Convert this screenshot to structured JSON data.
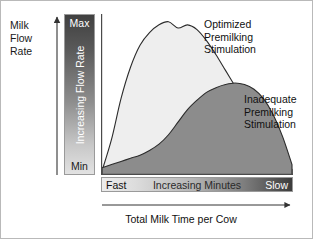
{
  "axes": {
    "y_caption_lines": [
      "Milk",
      "Flow",
      "Rate"
    ],
    "y_ramp": {
      "max_label": "Max",
      "min_label": "Min",
      "rotated_label": "Increasing Flow Rate"
    },
    "x_ramp": {
      "left_label": "Fast",
      "center_label": "Increasing Minutes",
      "right_label": "Slow"
    },
    "bottom_caption": "Total Milk Time per Cow"
  },
  "callouts": {
    "optimized": [
      "Optimized",
      "Premilking",
      "Stimulation"
    ],
    "inadequate": [
      "Inadequate",
      "Premilking",
      "Stimulation"
    ]
  },
  "colors": {
    "optimized_fill": "#eeeeee",
    "inadequate_fill": "#8c8c8c",
    "curve_stroke": "#2b2b2b",
    "plot_border": "#4a4a4a"
  },
  "chart_data": {
    "type": "area",
    "title": "",
    "subtitle": "",
    "xlabel": "Total Milk Time per Cow",
    "ylabel": "Milk Flow Rate",
    "x_axis": {
      "label": "Increasing Minutes",
      "left_tick": "Fast",
      "right_tick": "Slow",
      "range_labels": [
        "Fast",
        "Slow"
      ],
      "gradient": true,
      "ticks": []
    },
    "y_axis": {
      "label": "Increasing Flow Rate",
      "bottom_tick": "Min",
      "top_tick": "Max",
      "range_labels": [
        "Min",
        "Max"
      ],
      "gradient": true,
      "ticks": []
    },
    "grid": false,
    "legend": "inline-callouts",
    "legend_position": "right",
    "annotations": [
      {
        "text": "Optimized Premilking Stimulation",
        "target_series": "Optimized Premilking Stimulation",
        "arrow": true
      },
      {
        "text": "Inadequate Premilking Stimulation",
        "target_series": "Inadequate Premilking Stimulation",
        "arrow": true
      }
    ],
    "x": [
      0,
      5,
      10,
      15,
      20,
      25,
      30,
      35,
      40,
      45,
      50,
      55,
      60,
      65,
      70,
      75,
      80,
      85,
      90,
      95,
      100
    ],
    "series": [
      {
        "name": "Optimized Premilking Stimulation",
        "fill": "#eeeeee",
        "values": [
          2,
          22,
          48,
          68,
          82,
          90,
          95,
          97,
          93,
          95,
          92,
          85,
          76,
          66,
          56,
          46,
          36,
          26,
          17,
          9,
          3
        ]
      },
      {
        "name": "Inadequate Premilking Stimulation",
        "fill": "#8c8c8c",
        "values": [
          4,
          6,
          8,
          10,
          12,
          15,
          19,
          25,
          33,
          41,
          47,
          52,
          55,
          57,
          58,
          57,
          54,
          48,
          38,
          24,
          6
        ]
      }
    ]
  }
}
